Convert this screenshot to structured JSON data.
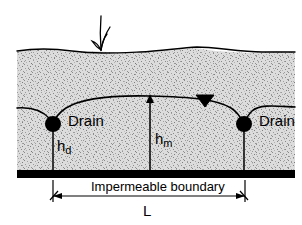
{
  "figure": {
    "type": "engineering-cross-section-diagram",
    "width": 302,
    "height": 225,
    "background_color": "#ffffff",
    "soil_fill_color": "#d8d8d8",
    "line_color": "#000000"
  },
  "labels": {
    "drain_left": "Drain",
    "drain_right": "Drain",
    "h_d_base": "h",
    "h_d_sub": "d",
    "h_m_base": "h",
    "h_m_sub": "m",
    "impermeable_boundary": "Impermeable boundary",
    "spacing": "L"
  },
  "elements": {
    "ground_surface": "ground-surface-line",
    "grass_tuft": "grass-tuft",
    "water_table": "water-table-curve",
    "water_table_symbol": "water-table-triangle",
    "soil_region": "soil-hatch-region",
    "impermeable_layer": "impermeable-boundary-bar",
    "drain_pipe_left": "drain-pipe-left",
    "drain_pipe_right": "drain-pipe-right",
    "dim_hd": "dimension-line-hd",
    "dim_hm": "dimension-arrow-hm",
    "dim_L": "dimension-arrow-L"
  },
  "geometry": {
    "soil_left_x": 17,
    "soil_right_x": 295,
    "ground_surface_y": 50,
    "impermeable_top_y": 170,
    "impermeable_bottom_y": 178,
    "drain_left_x": 53,
    "drain_right_x": 244,
    "drain_center_y": 124,
    "drain_radius": 8,
    "water_table_crest_y": 96,
    "hm_arrow_x": 150,
    "L_dimension_y": 196,
    "L_left_x": 53,
    "L_right_x": 245
  }
}
